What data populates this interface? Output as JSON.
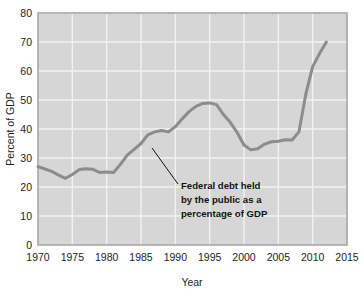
{
  "chart_data": {
    "type": "line",
    "title": "",
    "xlabel": "Year",
    "ylabel": "Percent of GDP",
    "xlim": [
      1970,
      2015
    ],
    "ylim": [
      0,
      80
    ],
    "xticks": [
      1970,
      1975,
      1980,
      1985,
      1990,
      1995,
      2000,
      2005,
      2010,
      2015
    ],
    "yticks": [
      0,
      10,
      20,
      30,
      40,
      50,
      60,
      70,
      80
    ],
    "grid": true,
    "legend_position": "none",
    "series": [
      {
        "name": "Federal debt held by the public as a percentage of GDP",
        "color": "#8c8c8c",
        "x": [
          1970,
          1971,
          1972,
          1973,
          1974,
          1975,
          1976,
          1977,
          1978,
          1979,
          1980,
          1981,
          1982,
          1983,
          1984,
          1985,
          1986,
          1987,
          1988,
          1989,
          1990,
          1991,
          1992,
          1993,
          1994,
          1995,
          1996,
          1997,
          1998,
          1999,
          2000,
          2001,
          2002,
          2003,
          2004,
          2005,
          2006,
          2007,
          2008,
          2009,
          2010,
          2011,
          2012
        ],
        "values": [
          27.0,
          26.2,
          25.4,
          24.1,
          23.0,
          24.3,
          26.0,
          26.3,
          26.1,
          25.0,
          25.2,
          25.0,
          27.8,
          31.0,
          33.0,
          35.0,
          38.0,
          39.0,
          39.5,
          39.0,
          40.8,
          43.5,
          46.0,
          47.8,
          48.8,
          49.0,
          48.4,
          45.0,
          42.3,
          38.8,
          34.5,
          32.8,
          33.2,
          34.8,
          35.6,
          35.8,
          36.3,
          36.2,
          39.0,
          52.0,
          61.5,
          66.0,
          70.0
        ]
      }
    ],
    "annotations": [
      {
        "text_lines": [
          "Federal debt held",
          "by the public as a",
          "percentage of GDP"
        ],
        "points_to_x": 1985,
        "points_to_y": 35
      }
    ]
  },
  "axis": {
    "y_label": "Percent of GDP",
    "x_label": "Year",
    "y_tick_labels": [
      "80",
      "70",
      "60",
      "50",
      "40",
      "30",
      "20",
      "10",
      "0"
    ],
    "x_tick_labels": [
      "1970",
      "1975",
      "1980",
      "1985",
      "1990",
      "1995",
      "2000",
      "2005",
      "2010",
      "2015"
    ]
  },
  "annotation": {
    "line1": "Federal debt held",
    "line2": "by the public as a",
    "line3": "percentage of GDP"
  },
  "colors": {
    "plot_background": "#d6d6d6",
    "gridline": "#f2f2f2",
    "data_line": "#8c8c8c",
    "axis_border": "#a8a8a8",
    "text": "#1c1c1c"
  }
}
